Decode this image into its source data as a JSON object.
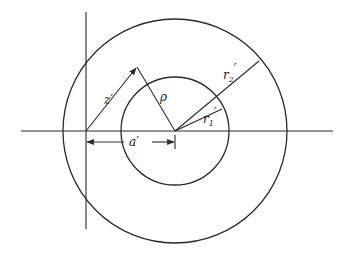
{
  "diagram": {
    "type": "concentric-circles-geometry",
    "labels": {
      "z": "z′",
      "rho": "ρ",
      "a": "a′",
      "r1": "r",
      "r1_sub": "1",
      "r1_prime": "′",
      "r2": "r",
      "r2_sub": "2",
      "r2_prime": "′"
    },
    "stroke_color": "#2a2a2a"
  }
}
